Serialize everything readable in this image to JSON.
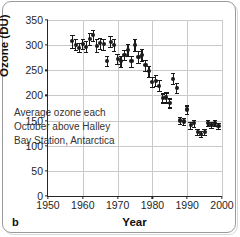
{
  "figure": {
    "panel_label": "b"
  },
  "chart_data": {
    "type": "scatter",
    "title": "",
    "xlabel": "Year",
    "ylabel": "Ozone (DU)",
    "xlim": [
      1950,
      2000
    ],
    "ylim": [
      0,
      350
    ],
    "xticks": [
      1950,
      1960,
      1970,
      1980,
      1990,
      2000
    ],
    "yticks": [
      0,
      50,
      100,
      150,
      200,
      250,
      300,
      350
    ],
    "grid": true,
    "legend": null,
    "annotations": [
      "Average ozone each",
      "October above Halley",
      "Bay Station, Antarctica"
    ],
    "marker_color": "#1a1a1a",
    "error_bars": true,
    "series": [
      {
        "name": "Average October ozone, Halley Bay Station",
        "x": [
          1957,
          1958,
          1959,
          1960,
          1961,
          1962,
          1963,
          1964,
          1965,
          1966,
          1967,
          1968,
          1969,
          1970,
          1971,
          1972,
          1973,
          1974,
          1975,
          1976,
          1977,
          1978,
          1979,
          1980,
          1981,
          1982,
          1983,
          1984,
          1985,
          1986,
          1987,
          1988,
          1989,
          1990,
          1991,
          1992,
          1993,
          1994,
          1995,
          1996,
          1997,
          1998,
          1999
        ],
        "y": [
          308,
          301,
          295,
          302,
          297,
          312,
          320,
          299,
          304,
          302,
          268,
          307,
          300,
          272,
          268,
          281,
          290,
          268,
          300,
          277,
          281,
          260,
          248,
          226,
          229,
          219,
          195,
          196,
          185,
          233,
          215,
          150,
          148,
          172,
          141,
          145,
          128,
          124,
          127,
          145,
          142,
          145,
          140
        ],
        "yerr": [
          13,
          11,
          9,
          10,
          11,
          12,
          11,
          13,
          11,
          11,
          10,
          11,
          12,
          10,
          11,
          10,
          12,
          11,
          12,
          12,
          12,
          11,
          11,
          10,
          11,
          11,
          9,
          10,
          9,
          11,
          10,
          7,
          7,
          8,
          7,
          7,
          6,
          6,
          6,
          6,
          6,
          6,
          6
        ]
      }
    ]
  }
}
